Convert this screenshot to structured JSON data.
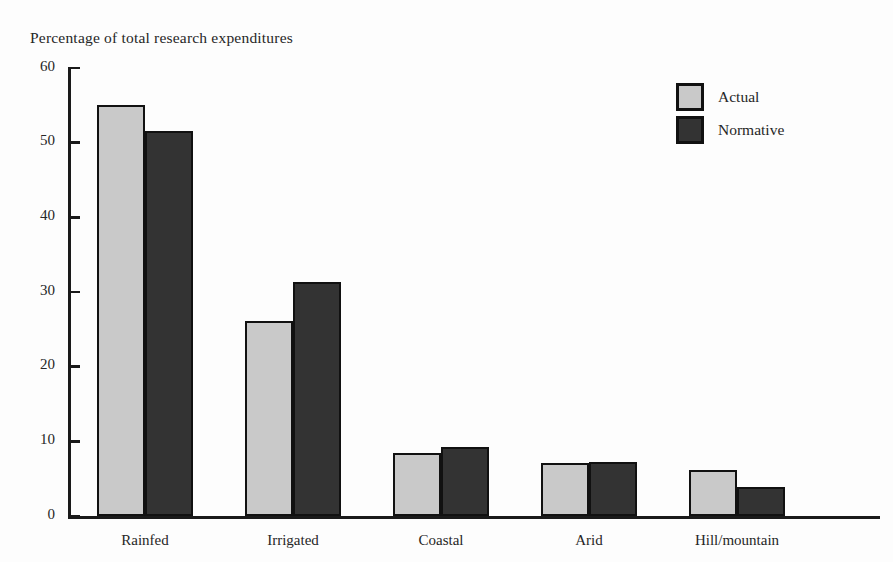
{
  "chart_data": {
    "type": "bar",
    "title": "Percentage of total research expenditures",
    "xlabel": "",
    "ylabel": "",
    "ylim": [
      0,
      60
    ],
    "yticks": [
      0,
      10,
      20,
      30,
      40,
      50,
      60
    ],
    "ytick_labels": [
      "0",
      "10",
      "20",
      "30",
      "40",
      "50",
      "60"
    ],
    "grid": false,
    "legend_position": "top-right",
    "categories": [
      "Rainfed",
      "Irrigated",
      "Coastal",
      "Arid",
      "Hill/mountain"
    ],
    "series": [
      {
        "name": "Actual",
        "color": "#c9c9c9",
        "values": [
          55.0,
          26.1,
          8.4,
          7.1,
          6.1
        ]
      },
      {
        "name": "Normative",
        "color": "#333333",
        "values": [
          51.6,
          31.3,
          9.3,
          7.2,
          3.9
        ]
      }
    ]
  },
  "legend": {
    "items": [
      {
        "label": "Actual",
        "swatch": "actual"
      },
      {
        "label": "Normative",
        "swatch": "normative"
      }
    ]
  },
  "colors": {
    "actual": "#c9c9c9",
    "normative": "#333333",
    "axis": "#1a1a1a",
    "text": "#262626",
    "background": "#fdfdfd"
  }
}
